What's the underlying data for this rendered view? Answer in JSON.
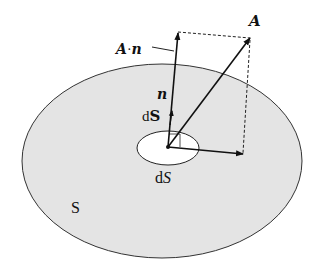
{
  "diagram": {
    "type": "surface-flux-vector-diagram",
    "labels": {
      "vector_A": "A",
      "projection": "A·n",
      "projection_A": "A",
      "projection_dot": "·",
      "projection_n": "n",
      "normal": "n",
      "area_vector_d": "d",
      "area_vector_S": "S",
      "area_element_d": "d",
      "area_element_S": "S",
      "surface": "S"
    },
    "colors": {
      "surface_fill": "#e4e4e4",
      "outline": "#333333",
      "element_fill": "#ffffff",
      "arrow": "#111111"
    },
    "elements": [
      "surface S (large shaded ellipse)",
      "area element dS (small white ellipse)",
      "normal vector n / dS",
      "vector A",
      "projection A·n on normal",
      "tangential component with dashed parallelogram"
    ]
  }
}
